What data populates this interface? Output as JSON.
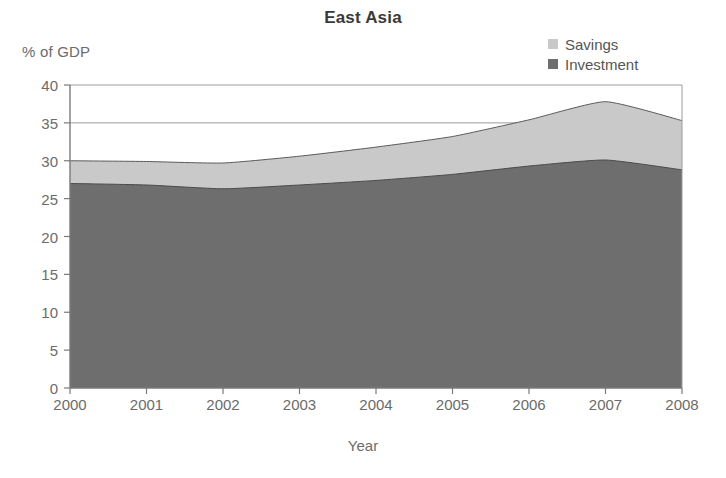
{
  "chart_data": {
    "type": "area",
    "title": "East Asia",
    "xlabel": "Year",
    "ylabel": "% of GDP",
    "categories": [
      "2000",
      "2001",
      "2002",
      "2003",
      "2004",
      "2005",
      "2006",
      "2007",
      "2008"
    ],
    "x": [
      2000,
      2001,
      2002,
      2003,
      2004,
      2005,
      2006,
      2007,
      2008
    ],
    "xlim": [
      2000,
      2008
    ],
    "ylim": [
      0,
      40
    ],
    "yticks": [
      0,
      5,
      10,
      15,
      20,
      25,
      30,
      35,
      40
    ],
    "ytick_labels": [
      "0",
      "5",
      "10",
      "15",
      "20",
      "25",
      "30",
      "35",
      "40"
    ],
    "grid": false,
    "stacked": true,
    "legend_position": "top-right",
    "series": [
      {
        "name": "Savings",
        "color": "#c9c9c9",
        "values": [
          30.0,
          29.9,
          29.7,
          30.6,
          31.8,
          33.2,
          35.4,
          37.8,
          35.3
        ]
      },
      {
        "name": "Investment",
        "color": "#6e6e6e",
        "values": [
          27.0,
          26.8,
          26.3,
          26.8,
          27.4,
          28.2,
          29.3,
          30.1,
          28.8
        ]
      }
    ],
    "note": "Savings values are the outer (total) boundary; Investment is the lower filled band."
  },
  "legend": {
    "items": [
      {
        "label": "Savings",
        "swatch": "savings-swatch"
      },
      {
        "label": "Investment",
        "swatch": "investment-swatch"
      }
    ]
  },
  "colors": {
    "savings": "#c9c9c9",
    "investment": "#6e6e6e",
    "axis": "#7a7a7a",
    "text": "#6b6b6b",
    "title": "#3a3a3a"
  }
}
